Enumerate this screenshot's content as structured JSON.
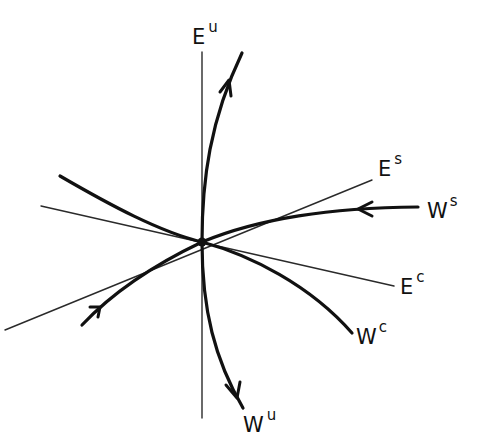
{
  "figure": {
    "colors": {
      "background": "#ffffff",
      "ink": "#111111"
    },
    "fixed_point": {
      "x": 202,
      "y": 242
    },
    "labels": {
      "Eu": {
        "base": "E",
        "sup": "u"
      },
      "Es": {
        "base": "E",
        "sup": "s"
      },
      "Ec": {
        "base": "E",
        "sup": "c"
      },
      "Ws": {
        "base": "W",
        "sup": "s"
      },
      "Wc": {
        "base": "W",
        "sup": "c"
      },
      "Wu": {
        "base": "W",
        "sup": "u"
      }
    },
    "subspaces": [
      {
        "name": "E^u",
        "kind": "linear-subspace",
        "style": "thin"
      },
      {
        "name": "E^s",
        "kind": "linear-subspace",
        "style": "thin"
      },
      {
        "name": "E^c",
        "kind": "linear-subspace",
        "style": "thin"
      }
    ],
    "manifolds": [
      {
        "name": "W^u",
        "kind": "unstable-manifold",
        "style": "thick",
        "arrows": "outward"
      },
      {
        "name": "W^s",
        "kind": "stable-manifold",
        "style": "thick",
        "arrows": "inward"
      },
      {
        "name": "W^c",
        "kind": "center-manifold",
        "style": "thick",
        "arrows": "none"
      }
    ]
  }
}
